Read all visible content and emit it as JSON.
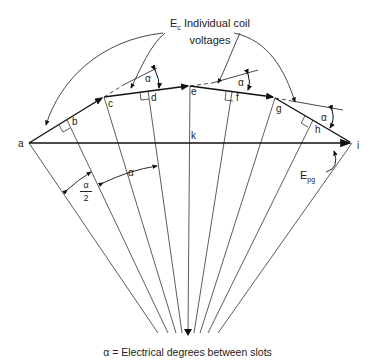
{
  "diagram": {
    "title_main": "E",
    "title_sub": "c",
    "title_rest": "Individual coil",
    "title_line2": "voltages",
    "points": {
      "a": "a",
      "b": "b",
      "c": "c",
      "d": "d",
      "e": "e",
      "f": "f",
      "g": "g",
      "h": "h",
      "i": "i",
      "k": "k"
    },
    "alpha": "α",
    "alpha_half_num": "α",
    "alpha_half_den": "2",
    "epg_main": "E",
    "epg_sub": "pg",
    "caption": "α = Electrical degrees between slots"
  }
}
